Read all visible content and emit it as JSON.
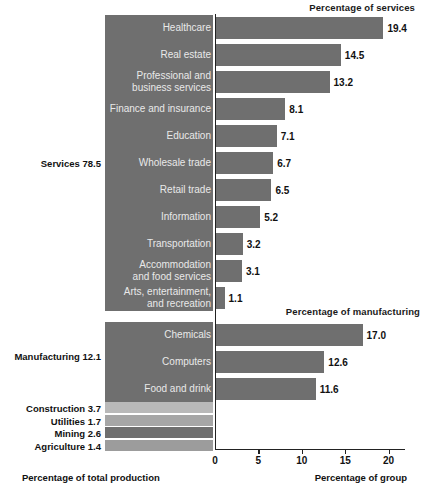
{
  "chart_data": {
    "type": "bar",
    "title": "",
    "orientation": "horizontal",
    "xlabel_left": "Percentage of total production",
    "xlabel_right": "Percentage of group",
    "xlim": [
      0,
      22.5
    ],
    "ticks": [
      0,
      5,
      10,
      15,
      20
    ],
    "grid": false,
    "legend": "none",
    "panels": [
      {
        "name": "services",
        "heading": "Percentage of services",
        "group_label": "Services 78.5",
        "group_value": 78.5,
        "categories": [
          "Healthcare",
          "Real estate",
          "Professional and\nbusiness services",
          "Finance and insurance",
          "Education",
          "Wholesale trade",
          "Retail trade",
          "Information",
          "Transportation",
          "Accommodation\nand food services",
          "Arts, entertainment,\nand recreation"
        ],
        "values": [
          19.4,
          14.5,
          13.2,
          8.1,
          7.1,
          6.7,
          6.5,
          5.2,
          3.2,
          3.1,
          1.1
        ],
        "value_labels": [
          "19.4",
          "14.5",
          "13.2",
          "8.1",
          "7.1",
          "6.7",
          "6.5",
          "5.2",
          "3.2",
          "3.1",
          "1.1"
        ]
      },
      {
        "name": "manufacturing",
        "heading": "Percentage of manufacturing",
        "group_label": "Manufacturing 12.1",
        "group_value": 12.1,
        "categories": [
          "Chemicals",
          "Computers",
          "Food and drink"
        ],
        "values": [
          17.0,
          12.6,
          11.6
        ],
        "value_labels": [
          "17.0",
          "12.6",
          "11.6"
        ]
      }
    ],
    "other_sectors": [
      {
        "label": "Construction 3.7",
        "value": 3.7,
        "color": "#b9b9b9"
      },
      {
        "label": "Utilities 1.7",
        "value": 1.7,
        "color": "#a6a6a6"
      },
      {
        "label": "Mining 2.6",
        "value": 2.6,
        "color": "#6f6f6f"
      },
      {
        "label": "Agriculture 1.4",
        "value": 1.4,
        "color": "#9c9c9c"
      }
    ]
  },
  "colors": {
    "bar": "#6f6f6f",
    "panel": "#6f6f6f",
    "panel_text": "#e9e9e9",
    "axis": "#222222",
    "background": "#ffffff"
  }
}
